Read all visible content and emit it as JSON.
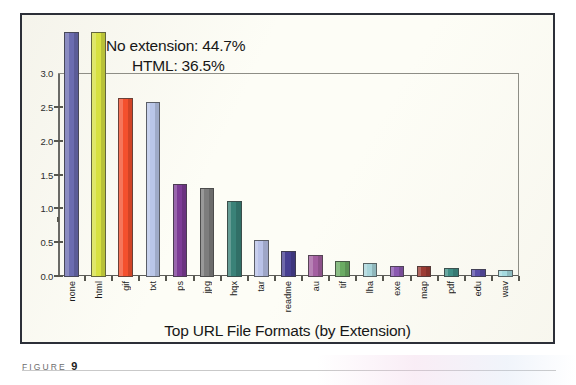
{
  "caption": {
    "label": "FIGURE",
    "number": "9"
  },
  "annotations": [
    {
      "name": "no-extension",
      "text": "No extension: 44.7%"
    },
    {
      "name": "html",
      "text": "HTML: 36.5%"
    }
  ],
  "chart_data": {
    "type": "bar",
    "title": "Top URL File Formats (by Extension)",
    "xlabel": "",
    "ylabel": "",
    "ylim": [
      0,
      3.0
    ],
    "yticks": [
      "0.0",
      "0.5",
      "1.0",
      "1.5",
      "2.0",
      "2.5",
      "3.0"
    ],
    "ytick_values": [
      0,
      0.5,
      1.0,
      1.5,
      2.0,
      2.5,
      3.0
    ],
    "grid": false,
    "legend": "none",
    "note": "First two bars exceed the 3.0 axis and are labelled by annotation",
    "categories": [
      "none",
      "html",
      "gif",
      "txt",
      "ps",
      "jpg",
      "hqx",
      "tar",
      "readme",
      "au",
      "tif",
      "lha",
      "exe",
      "map",
      "pdf",
      "edu",
      "wav"
    ],
    "values": [
      3.45,
      3.3,
      2.65,
      2.58,
      1.38,
      1.32,
      1.13,
      0.54,
      0.38,
      0.33,
      0.23,
      0.21,
      0.17,
      0.16,
      0.14,
      0.12,
      0.11
    ],
    "display_values": [
      "44.7%",
      "36.5%",
      "",
      "",
      "",
      "",
      "",
      "",
      "",
      "",
      "",
      "",
      "",
      "",
      "",
      "",
      ""
    ],
    "colors": [
      "#6b6cb0",
      "#d7e140",
      "#f4502d",
      "#b9c6e8",
      "#7d3c96",
      "#7d7d7d",
      "#3a8278",
      "#b9c2e8",
      "#473f91",
      "#a35fa0",
      "#6aab62",
      "#a8d5da",
      "#8b59b0",
      "#9c3b33",
      "#3f8f86",
      "#5a4fa8",
      "#a6dbe0"
    ]
  }
}
